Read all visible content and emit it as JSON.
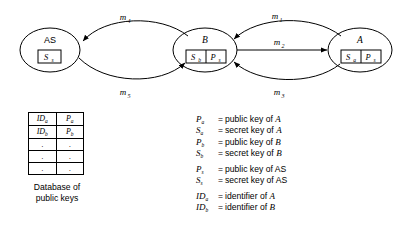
{
  "diagram": {
    "nodes": [
      {
        "id": "as",
        "label": "AS",
        "label_style": "upright",
        "keys": [
          "S_s"
        ],
        "key_cells": [
          {
            "base": "S",
            "sub": "s"
          }
        ]
      },
      {
        "id": "b",
        "label": "B",
        "label_style": "italic",
        "keys": [
          "S_b",
          "P_s"
        ],
        "key_cells": [
          {
            "base": "S",
            "sub": "b"
          },
          {
            "base": "P",
            "sub": "s"
          }
        ]
      },
      {
        "id": "a",
        "label": "A",
        "label_style": "italic",
        "keys": [
          "S_a",
          "P_s"
        ],
        "key_cells": [
          {
            "base": "S",
            "sub": "a"
          },
          {
            "base": "P",
            "sub": "s"
          }
        ]
      }
    ],
    "messages": [
      {
        "id": "m1",
        "base": "m",
        "sub": "1",
        "from": "a",
        "to": "b",
        "shape": "curve-up",
        "label_pos": "above"
      },
      {
        "id": "m2",
        "base": "m",
        "sub": "2",
        "from": "b",
        "to": "a",
        "shape": "straight",
        "label_pos": "above"
      },
      {
        "id": "m3",
        "base": "m",
        "sub": "3",
        "from": "a",
        "to": "b",
        "shape": "curve-down",
        "label_pos": "below"
      },
      {
        "id": "m4",
        "base": "m",
        "sub": "4",
        "from": "b",
        "to": "as",
        "shape": "curve-up",
        "label_pos": "above"
      },
      {
        "id": "m5",
        "base": "m",
        "sub": "5",
        "from": "as",
        "to": "b",
        "shape": "curve-down",
        "label_pos": "below"
      }
    ],
    "stroke_color": "#000000",
    "background_color": "#ffffff"
  },
  "database": {
    "caption_line1": "Database of",
    "caption_line2": "public keys",
    "rows": [
      [
        {
          "base": "ID",
          "sub": "a"
        },
        {
          "base": "P",
          "sub": "a"
        }
      ],
      [
        {
          "base": "ID",
          "sub": "b"
        },
        {
          "base": "P",
          "sub": "b"
        }
      ]
    ],
    "dot_rows": 3,
    "dot_char": "."
  },
  "legend": {
    "equals": "=",
    "entries": [
      {
        "sym_base": "P",
        "sym_sub": "a",
        "desc_prefix": "public key of ",
        "desc_italic": "A",
        "gap_before": false
      },
      {
        "sym_base": "S",
        "sym_sub": "a",
        "desc_prefix": "secret key of ",
        "desc_italic": "A",
        "gap_before": false
      },
      {
        "sym_base": "P",
        "sym_sub": "b",
        "desc_prefix": "public key of ",
        "desc_italic": "B",
        "gap_before": false
      },
      {
        "sym_base": "S",
        "sym_sub": "b",
        "desc_prefix": "secret key of ",
        "desc_italic": "B",
        "gap_before": false
      },
      {
        "sym_base": "P",
        "sym_sub": "s",
        "desc_prefix": "public key of AS",
        "desc_italic": "",
        "gap_before": true
      },
      {
        "sym_base": "S",
        "sym_sub": "s",
        "desc_prefix": "secret key of AS",
        "desc_italic": "",
        "gap_before": false
      },
      {
        "sym_base": "ID",
        "sym_sub": "a",
        "desc_prefix": "identifier of ",
        "desc_italic": "A",
        "gap_before": true
      },
      {
        "sym_base": "ID",
        "sym_sub": "b",
        "desc_prefix": "identifier of ",
        "desc_italic": "B",
        "gap_before": false
      }
    ]
  }
}
